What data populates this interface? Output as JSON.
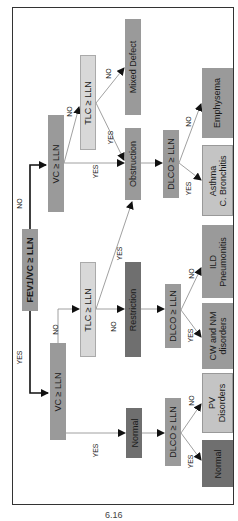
{
  "diagram": {
    "type": "flowchart",
    "orientation": "rotated-90-ccw",
    "root": {
      "label": "FEV1/VC ≥ LLN"
    },
    "nodes": {
      "vc_top": "VC ≥ LLN",
      "tlc_top": "TLC ≥ LLN",
      "mixed_defect": "Mixed Defect",
      "obstruction": "Obstruction",
      "dlco_top": "DLCO ≥ LLN",
      "emphysema": "Emphysema",
      "asthma_line1": "Asthma",
      "asthma_line2": "C. Bronchitis",
      "tlc_bottom": "TLC ≥ LLN",
      "restriction": "Restriction",
      "dlco_mid": "DLCO ≥ LLN",
      "ild_line1": "ILD",
      "ild_line2": "Pneumonitis",
      "cw_line1": "CW and NM",
      "cw_line2": "disorders",
      "vc_bottom": "VC ≥ LLN",
      "normal_mid": "Normal",
      "dlco_bottom": "DLCO ≥ LLN",
      "pv_line1": "PV",
      "pv_line2": "Disorders",
      "normal_final": "Normal"
    },
    "edge_labels": {
      "root_no": "NO",
      "root_yes": "YES",
      "vc_top_no": "NO",
      "vc_top_yes": "YES",
      "tlc_top_no": "NO",
      "tlc_top_yes": "YES",
      "dlco_top_no": "NO",
      "dlco_top_yes": "YES",
      "vc_bottom_no": "NO",
      "vc_bottom_yes": "YES",
      "tlc_bottom_no": "NO",
      "tlc_bottom_yes": "YES",
      "dlco_mid_no": "NO",
      "dlco_mid_yes": "YES",
      "dlco_bottom_no": "NO",
      "dlco_bottom_yes": "YES"
    },
    "caption": "6.16"
  }
}
